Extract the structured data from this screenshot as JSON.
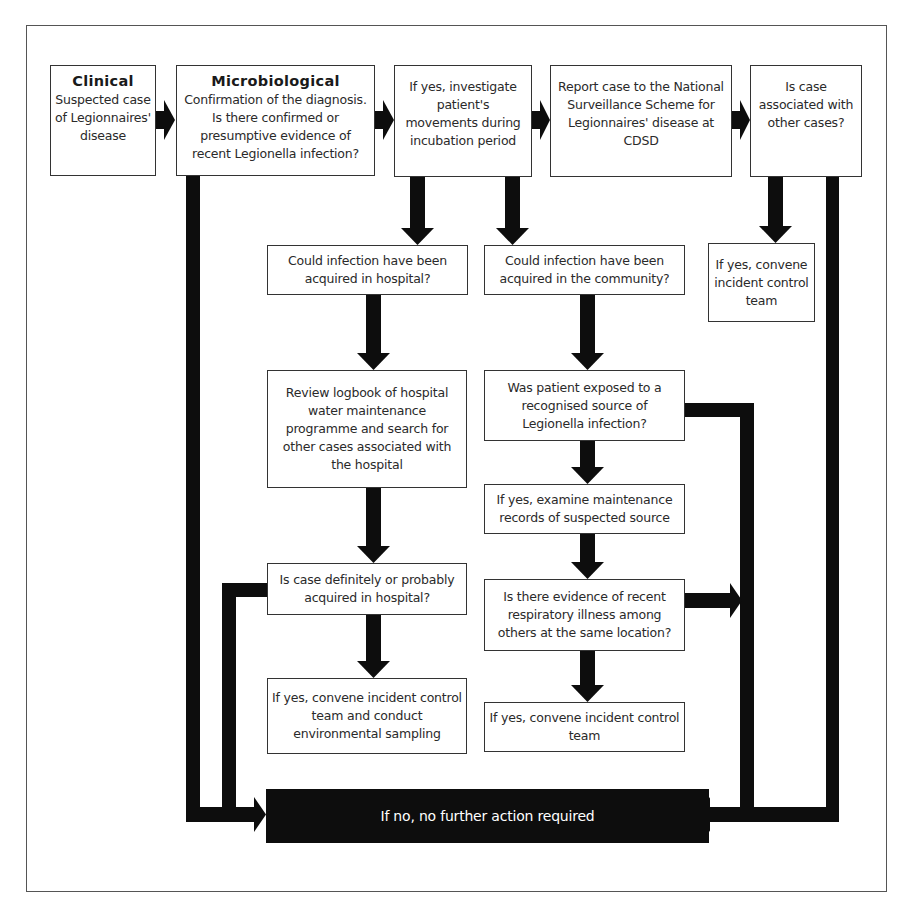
{
  "diagram": {
    "type": "flowchart",
    "nodes": {
      "clinical": {
        "title": "Clinical",
        "text": "Suspected case of Legionnaires' disease"
      },
      "microbiological": {
        "title": "Microbiological",
        "text": "Confirmation of the diagnosis. Is there confirmed or presumptive evidence of recent Legionella infection?"
      },
      "investigate": {
        "text": "If yes, investigate patient's movements during incubation period"
      },
      "report": {
        "text": "Report case to the National Surveillance Scheme for Legionnaires' disease at CDSD"
      },
      "associated": {
        "text": "Is case associated with other cases?"
      },
      "associated_yes": {
        "text": "If yes, convene incident control team"
      },
      "hospital_q": {
        "text": "Could infection have been acquired in hospital?"
      },
      "community_q": {
        "text": "Could infection have been acquired in the community?"
      },
      "review_logbook": {
        "text": "Review logbook of hospital water maintenance programme and search for other cases associated with the hospital"
      },
      "exposed_q": {
        "text": "Was patient exposed to a recognised source of Legionella infection?"
      },
      "examine_records": {
        "text": "If yes, examine maintenance records of suspected source"
      },
      "hospital_definite_q": {
        "text": "Is case definitely or probably acquired in hospital?"
      },
      "respiratory_q": {
        "text": "Is there evidence of recent respiratory illness among others at the same location?"
      },
      "hospital_yes": {
        "text": "If yes, convene incident control team and conduct environmental sampling"
      },
      "community_yes": {
        "text": "If yes, convene incident control team"
      },
      "no_action": {
        "text": "If no, no further action required"
      }
    },
    "edges": [
      [
        "clinical",
        "microbiological"
      ],
      [
        "microbiological",
        "investigate"
      ],
      [
        "investigate",
        "report"
      ],
      [
        "report",
        "associated"
      ],
      [
        "associated",
        "associated_yes"
      ],
      [
        "investigate",
        "hospital_q"
      ],
      [
        "investigate",
        "community_q"
      ],
      [
        "hospital_q",
        "review_logbook"
      ],
      [
        "review_logbook",
        "hospital_definite_q"
      ],
      [
        "hospital_definite_q",
        "hospital_yes"
      ],
      [
        "community_q",
        "exposed_q"
      ],
      [
        "exposed_q",
        "examine_records"
      ],
      [
        "examine_records",
        "respiratory_q"
      ],
      [
        "respiratory_q",
        "community_yes"
      ],
      [
        "microbiological",
        "no_action"
      ],
      [
        "hospital_definite_q",
        "no_action"
      ],
      [
        "exposed_q",
        "no_action"
      ],
      [
        "respiratory_q",
        "no_action"
      ],
      [
        "associated",
        "no_action"
      ]
    ]
  }
}
